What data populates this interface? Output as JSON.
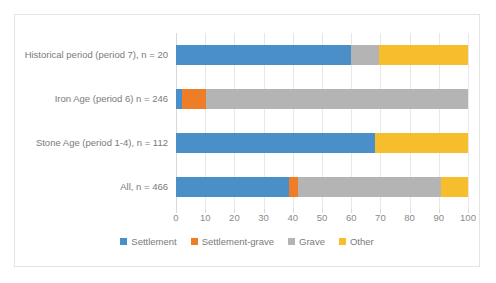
{
  "chart_data": {
    "type": "bar",
    "orientation": "horizontal",
    "stacked": true,
    "stack_mode": "percent",
    "title": "",
    "xlabel": "",
    "ylabel": "",
    "xlim": [
      0,
      100
    ],
    "xticks": [
      0,
      10,
      20,
      30,
      40,
      50,
      60,
      70,
      80,
      90,
      100
    ],
    "xtick_labels": [
      "0",
      "10",
      "20",
      "30",
      "40",
      "50",
      "60",
      "70",
      "80",
      "90",
      "100"
    ],
    "grid": "vertical",
    "legend_position": "bottom",
    "categories": [
      "Historical period (period 7), n = 20",
      "Iron Age (period 6) n = 246",
      "Stone Age (period 1-4), n = 112",
      "All, n = 466"
    ],
    "series": [
      {
        "name": "Settlement",
        "color": "#4a8fc8",
        "values": [
          60.0,
          2.0,
          68.2,
          38.7
        ]
      },
      {
        "name": "Settlement-grave",
        "color": "#ed7d26",
        "values": [
          0.0,
          8.3,
          0.0,
          3.1
        ]
      },
      {
        "name": "Grave",
        "color": "#b4b4b4",
        "values": [
          9.5,
          89.7,
          0.0,
          49.0
        ]
      },
      {
        "name": "Other",
        "color": "#f6bd2c",
        "values": [
          30.5,
          0.0,
          31.8,
          9.2
        ]
      }
    ]
  },
  "legend": {
    "items": [
      {
        "label": "Settlement",
        "color": "#4a8fc8"
      },
      {
        "label": "Settlement-grave",
        "color": "#ed7d26"
      },
      {
        "label": "Grave",
        "color": "#b4b4b4"
      },
      {
        "label": "Other",
        "color": "#f6bd2c"
      }
    ]
  }
}
